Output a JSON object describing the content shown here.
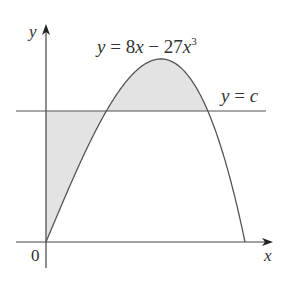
{
  "figure": {
    "curve_label": {
      "y": "y",
      "eq": " = 8",
      "x1": "x",
      "minus": " − 27",
      "x2": "x",
      "exp": "3"
    },
    "line_label": {
      "y": "y",
      "eq": " = ",
      "c": "c"
    },
    "axis_labels": {
      "x": "x",
      "y": "y",
      "origin": "0"
    },
    "colors": {
      "shade": "#e3e3e3",
      "stroke": "#555555"
    },
    "function": "y = 8x - 27x^3",
    "c_value": 1.2
  }
}
